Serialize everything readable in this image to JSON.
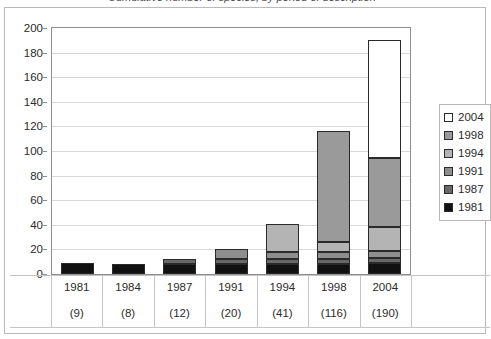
{
  "title_fragment": "Cumulative number of species, by period of description",
  "chart_data": {
    "type": "bar",
    "subtype": "stacked-column",
    "title": "",
    "xlabel": "",
    "ylabel": "",
    "ylim": [
      0,
      200
    ],
    "ytick_step": 20,
    "ytick_labels": [
      "200",
      "180",
      "160",
      "140",
      "120",
      "100",
      "80",
      "60",
      "40",
      "20",
      "0"
    ],
    "grid": true,
    "legend_position": "right",
    "categories": [
      "1981",
      "1984",
      "1987",
      "1991",
      "1994",
      "1998",
      "2004"
    ],
    "category_totals": [
      "(9)",
      "(8)",
      "(12)",
      "(20)",
      "(41)",
      "(116)",
      "(190)"
    ],
    "totals": [
      9,
      8,
      12,
      20,
      41,
      116,
      190
    ],
    "series": [
      {
        "name": "1981",
        "color": "#111111",
        "values": [
          9,
          8,
          8,
          8,
          8,
          8,
          9
        ]
      },
      {
        "name": "1987",
        "color": "#686868",
        "values": [
          0,
          0,
          4,
          4,
          4,
          4,
          4
        ]
      },
      {
        "name": "1991",
        "color": "#8e8e8e",
        "values": [
          0,
          0,
          0,
          8,
          6,
          6,
          6
        ]
      },
      {
        "name": "1994",
        "color": "#b4b4b4",
        "values": [
          0,
          0,
          0,
          0,
          23,
          8,
          19
        ]
      },
      {
        "name": "1998",
        "color": "#9a9a9a",
        "values": [
          0,
          0,
          0,
          0,
          0,
          90,
          56
        ]
      },
      {
        "name": "2004",
        "color": "#ffffff",
        "values": [
          0,
          0,
          0,
          0,
          0,
          0,
          96
        ]
      }
    ],
    "legend_entries": [
      {
        "label": "2004",
        "color": "#ffffff"
      },
      {
        "label": "1998",
        "color": "#9a9a9a"
      },
      {
        "label": "1994",
        "color": "#b4b4b4"
      },
      {
        "label": "1991",
        "color": "#8e8e8e"
      },
      {
        "label": "1987",
        "color": "#686868"
      },
      {
        "label": "1981",
        "color": "#111111"
      }
    ]
  }
}
